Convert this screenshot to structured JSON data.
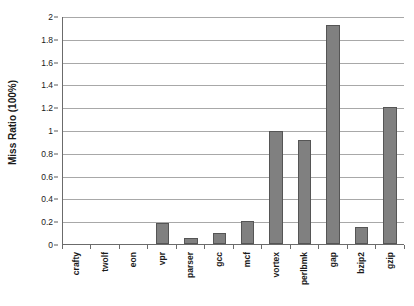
{
  "chart_data": {
    "type": "bar",
    "title": "",
    "subtitle": "",
    "xlabel": "",
    "ylabel": "Miss Ratio (100%)",
    "ylim": [
      0,
      2
    ],
    "ytick_step": 0.2,
    "yticks": [
      "0",
      "0.2",
      "0.4",
      "0.6",
      "0.8",
      "1",
      "1.2",
      "1.4",
      "1.6",
      "1.8",
      "2"
    ],
    "ytick_values": [
      0,
      0.2,
      0.4,
      0.6,
      0.8,
      1,
      1.2,
      1.4,
      1.6,
      1.8,
      2
    ],
    "grid": "horizontal",
    "legend": "none",
    "categories": [
      "crafty",
      "twolf",
      "eon",
      "vpr",
      "parser",
      "gcc",
      "mcf",
      "vortex",
      "perlbmk",
      "gap",
      "bzip2",
      "gzip"
    ],
    "values": [
      0,
      0,
      0,
      0.18,
      0.05,
      0.1,
      0.2,
      0.99,
      0.91,
      1.92,
      0.15,
      1.2
    ],
    "bar_color": "#808080",
    "bar_border_color": "#555555",
    "gridline_color": "#a8a8a8",
    "axis_color": "#6b6b6b",
    "text_color": "#1a1a1a",
    "background": "#ffffff"
  }
}
